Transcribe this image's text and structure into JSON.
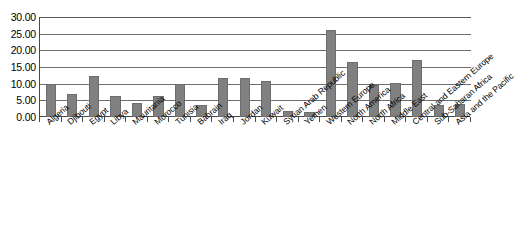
{
  "chart_data": {
    "type": "bar",
    "title": "",
    "subtitle": "",
    "xlabel": "",
    "ylabel": "",
    "ylim": [
      0,
      30
    ],
    "ytick_step": 5,
    "grid": true,
    "legend": false,
    "bar_color": "#808080",
    "axis_color": "#4a4a4a",
    "gridline_color": "#6e6e6e",
    "background_color": "#ffffff",
    "ytick_labels": [
      "30.00",
      "25.00",
      "20.00",
      "15.00",
      "10.00",
      "5.00",
      "0.00"
    ],
    "ytick_values": [
      30,
      25,
      20,
      15,
      10,
      5,
      0
    ],
    "categories": [
      "Algeria",
      "Djibouti",
      "Egypt",
      "Libya",
      "Mauritania",
      "Morocco",
      "Tunisia",
      "Bahrain",
      "Iraq",
      "Jordan",
      "Kuwait",
      "Syrian Arab Republic",
      "Yemen",
      "Western Europe",
      "North America",
      "North Africa",
      "Middle East",
      "Central and Eastern Europe",
      "Sub-Saharan Africa",
      "Asia and the Pacific"
    ],
    "values": [
      9.9,
      6.9,
      12.3,
      6.3,
      4.2,
      6.2,
      10.0,
      3.6,
      11.6,
      11.6,
      10.9,
      1.7,
      1.4,
      26.2,
      16.4,
      9.5,
      10.3,
      17.0,
      3.6,
      3.9
    ]
  }
}
